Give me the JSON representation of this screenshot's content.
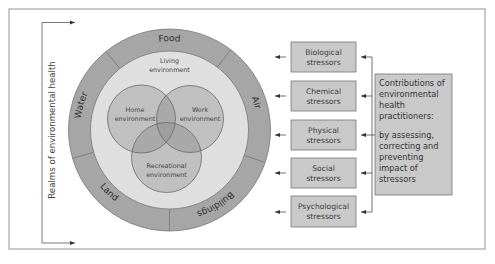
{
  "axis_label": "Realms of environmental health",
  "outer_ring": {
    "segments": [
      {
        "label": "Food"
      },
      {
        "label": "Air"
      },
      {
        "label": "Buildings"
      },
      {
        "label": "Land"
      },
      {
        "label": "Water"
      }
    ]
  },
  "inner_ring": {
    "label_line1": "Living",
    "label_line2": "environment"
  },
  "venn": [
    {
      "line1": "Home",
      "line2": "environment"
    },
    {
      "line1": "Work",
      "line2": "environment"
    },
    {
      "line1": "Recreational",
      "line2": "environment"
    }
  ],
  "stressors": [
    {
      "line1": "Biological",
      "line2": "stressors"
    },
    {
      "line1": "Chemical",
      "line2": "stressors"
    },
    {
      "line1": "Physical",
      "line2": "stressors"
    },
    {
      "line1": "Social",
      "line2": "stressors"
    },
    {
      "line1": "Psychological",
      "line2": "stressors"
    }
  ],
  "contributions": {
    "lines": [
      "Contributions of",
      "environmental",
      "health",
      "practitioners:",
      "",
      "by assessing,",
      "correcting and",
      "preventing",
      "impact of",
      "stressors"
    ]
  },
  "colors": {
    "outer_ring": "#a6a6a6",
    "inner_ring": "#dfdfdf",
    "venn_fill": "#bfbfbf",
    "box_fill": "#c9c9c9",
    "stroke": "#6e6e6e"
  }
}
